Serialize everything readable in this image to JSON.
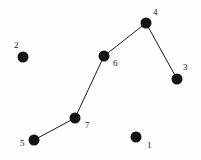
{
  "diagram": {
    "type": "node-link-graph",
    "background_color": "#fefefe",
    "node_color": "#141414",
    "edge_color": "#1a1a1a",
    "label_color": "#141414",
    "node_radius": 5.5,
    "edge_width": 1,
    "width": 201,
    "height": 160,
    "nodes": [
      {
        "id": "1",
        "label": "1",
        "cx": 136,
        "cy": 137,
        "label_x": 147,
        "label_y": 141
      },
      {
        "id": "2",
        "label": "2",
        "cx": 23,
        "cy": 57,
        "label_x": 14,
        "label_y": 41
      },
      {
        "id": "3",
        "label": "3",
        "cx": 177,
        "cy": 79,
        "label_x": 183,
        "label_y": 63
      },
      {
        "id": "4",
        "label": "4",
        "cx": 146,
        "cy": 23,
        "label_x": 153,
        "label_y": 8
      },
      {
        "id": "5",
        "label": "5",
        "cx": 34,
        "cy": 140,
        "label_x": 20,
        "label_y": 139
      },
      {
        "id": "6",
        "label": "6",
        "cx": 104,
        "cy": 56,
        "label_x": 113,
        "label_y": 59
      },
      {
        "id": "7",
        "label": "7",
        "cx": 75,
        "cy": 118,
        "label_x": 85,
        "label_y": 121
      }
    ],
    "edges": [
      {
        "id": "edge-5-7",
        "from": "5",
        "to": "7",
        "x1": 34,
        "y1": 140,
        "x2": 75,
        "y2": 118
      },
      {
        "id": "edge-7-6",
        "from": "7",
        "to": "6",
        "x1": 75,
        "y1": 118,
        "x2": 104,
        "y2": 56
      },
      {
        "id": "edge-6-4",
        "from": "6",
        "to": "4",
        "x1": 104,
        "y1": 56,
        "x2": 146,
        "y2": 23
      },
      {
        "id": "edge-4-3",
        "from": "4",
        "to": "3",
        "x1": 146,
        "y1": 23,
        "x2": 177,
        "y2": 79
      }
    ]
  }
}
